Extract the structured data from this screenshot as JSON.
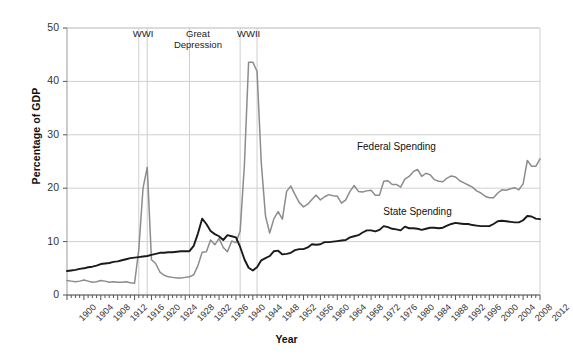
{
  "chart_data": {
    "type": "line",
    "title": "",
    "xlabel": "Year",
    "ylabel": "Percentage of GDP",
    "xlim": [
      1900,
      2012
    ],
    "ylim": [
      0,
      50
    ],
    "yticks": [
      0,
      10,
      20,
      30,
      40,
      50
    ],
    "xticks": [
      1900,
      1904,
      1908,
      1912,
      1916,
      1920,
      1924,
      1928,
      1932,
      1936,
      1940,
      1944,
      1948,
      1952,
      1956,
      1960,
      1964,
      1968,
      1972,
      1976,
      1980,
      1984,
      1988,
      1992,
      1996,
      2000,
      2004,
      2008,
      2012
    ],
    "grid": "horizontal-and-event-markers",
    "legend_position": "inline-labels",
    "colors": {
      "federal": "#8c8c8c",
      "state": "#1a1a1a",
      "grid": "#cfcfcf",
      "axis": "#9a9a9a",
      "background": "#ffffff",
      "text": "#222222"
    },
    "annotations": [
      {
        "label": "WWI",
        "x": 1917,
        "marker_years": [
          1917,
          1919
        ],
        "text_x": 1918,
        "text_y": 49
      },
      {
        "label": "Great\nDepression",
        "x": 1929,
        "marker_years": [
          1929
        ],
        "text_x": 1931,
        "text_y": 49
      },
      {
        "label": "WWII",
        "x": 1941,
        "marker_years": [
          1941,
          1945
        ],
        "text_x": 1943,
        "text_y": 49
      }
    ],
    "series": [
      {
        "name": "Federal Spending",
        "color": "#8c8c8c",
        "label_x": 1978,
        "label_y": 27.5,
        "x": [
          1900,
          1901,
          1902,
          1903,
          1904,
          1905,
          1906,
          1907,
          1908,
          1909,
          1910,
          1911,
          1912,
          1913,
          1914,
          1915,
          1916,
          1917,
          1918,
          1919,
          1920,
          1921,
          1922,
          1923,
          1924,
          1925,
          1926,
          1927,
          1928,
          1929,
          1930,
          1931,
          1932,
          1933,
          1934,
          1935,
          1936,
          1937,
          1938,
          1939,
          1940,
          1941,
          1942,
          1943,
          1944,
          1945,
          1946,
          1947,
          1948,
          1949,
          1950,
          1951,
          1952,
          1953,
          1954,
          1955,
          1956,
          1957,
          1958,
          1959,
          1960,
          1961,
          1962,
          1963,
          1964,
          1965,
          1966,
          1967,
          1968,
          1969,
          1970,
          1971,
          1972,
          1973,
          1974,
          1975,
          1976,
          1977,
          1978,
          1979,
          1980,
          1981,
          1982,
          1983,
          1984,
          1985,
          1986,
          1987,
          1988,
          1989,
          1990,
          1991,
          1992,
          1993,
          1994,
          1995,
          1996,
          1997,
          1998,
          1999,
          2000,
          2001,
          2002,
          2003,
          2004,
          2005,
          2006,
          2007,
          2008,
          2009,
          2010,
          2011,
          2012
        ],
        "y": [
          2.7,
          2.6,
          2.5,
          2.6,
          2.8,
          2.6,
          2.4,
          2.5,
          2.7,
          2.6,
          2.4,
          2.5,
          2.4,
          2.4,
          2.5,
          2.3,
          2.2,
          8.5,
          20.0,
          23.9,
          6.6,
          5.9,
          4.3,
          3.7,
          3.4,
          3.3,
          3.2,
          3.2,
          3.3,
          3.4,
          3.8,
          5.5,
          8.0,
          8.1,
          10.3,
          9.4,
          10.6,
          8.9,
          8.1,
          10.1,
          9.8,
          12.0,
          24.3,
          43.6,
          43.6,
          41.9,
          24.8,
          14.8,
          11.6,
          14.3,
          15.6,
          14.2,
          19.4,
          20.4,
          18.8,
          17.3,
          16.5,
          17.0,
          17.9,
          18.7,
          17.8,
          18.4,
          18.8,
          18.6,
          18.5,
          17.2,
          17.8,
          19.4,
          20.5,
          19.4,
          19.3,
          19.5,
          19.6,
          18.7,
          18.7,
          21.3,
          21.4,
          20.7,
          20.7,
          20.2,
          21.7,
          22.2,
          23.1,
          23.5,
          22.2,
          22.8,
          22.5,
          21.6,
          21.3,
          21.2,
          21.9,
          22.3,
          22.1,
          21.4,
          21.0,
          20.6,
          20.2,
          19.5,
          19.1,
          18.5,
          18.2,
          18.2,
          19.1,
          19.7,
          19.6,
          19.9,
          20.1,
          19.7,
          20.8,
          25.2,
          24.1,
          24.1,
          25.5
        ]
      },
      {
        "name": "State Spending",
        "color": "#1a1a1a",
        "label_x": 1983,
        "label_y": 15.4,
        "x": [
          1900,
          1901,
          1902,
          1903,
          1904,
          1905,
          1906,
          1907,
          1908,
          1909,
          1910,
          1911,
          1912,
          1913,
          1914,
          1915,
          1916,
          1917,
          1918,
          1919,
          1920,
          1921,
          1922,
          1923,
          1924,
          1925,
          1926,
          1927,
          1928,
          1929,
          1930,
          1931,
          1932,
          1933,
          1934,
          1935,
          1936,
          1937,
          1938,
          1939,
          1940,
          1941,
          1942,
          1943,
          1944,
          1945,
          1946,
          1947,
          1948,
          1949,
          1950,
          1951,
          1952,
          1953,
          1954,
          1955,
          1956,
          1957,
          1958,
          1959,
          1960,
          1961,
          1962,
          1963,
          1964,
          1965,
          1966,
          1967,
          1968,
          1969,
          1970,
          1971,
          1972,
          1973,
          1974,
          1975,
          1976,
          1977,
          1978,
          1979,
          1980,
          1981,
          1982,
          1983,
          1984,
          1985,
          1986,
          1987,
          1988,
          1989,
          1990,
          1991,
          1992,
          1993,
          1994,
          1995,
          1996,
          1997,
          1998,
          1999,
          2000,
          2001,
          2002,
          2003,
          2004,
          2005,
          2006,
          2007,
          2008,
          2009,
          2010,
          2011,
          2012
        ],
        "y": [
          4.5,
          4.6,
          4.7,
          4.9,
          5.0,
          5.2,
          5.3,
          5.5,
          5.8,
          5.9,
          6.0,
          6.2,
          6.3,
          6.5,
          6.7,
          6.9,
          7.0,
          7.1,
          7.2,
          7.3,
          7.5,
          7.7,
          7.9,
          7.9,
          8.0,
          8.0,
          8.1,
          8.2,
          8.2,
          8.2,
          9.2,
          11.5,
          14.3,
          13.3,
          12.0,
          11.4,
          11.0,
          10.3,
          11.2,
          11.0,
          10.8,
          9.0,
          6.7,
          5.1,
          4.6,
          5.2,
          6.5,
          6.9,
          7.3,
          8.2,
          8.3,
          7.6,
          7.7,
          7.9,
          8.4,
          8.6,
          8.6,
          8.9,
          9.5,
          9.4,
          9.5,
          9.9,
          9.9,
          10.0,
          10.1,
          10.2,
          10.3,
          10.8,
          11.0,
          11.2,
          11.7,
          12.1,
          12.1,
          11.9,
          12.2,
          12.9,
          12.7,
          12.4,
          12.3,
          12.1,
          12.8,
          12.5,
          12.5,
          12.4,
          12.2,
          12.4,
          12.6,
          12.6,
          12.5,
          12.6,
          13.0,
          13.3,
          13.5,
          13.4,
          13.3,
          13.3,
          13.1,
          13.0,
          12.9,
          12.9,
          12.9,
          13.3,
          13.8,
          13.9,
          13.8,
          13.7,
          13.6,
          13.6,
          14.0,
          14.8,
          14.7,
          14.3,
          14.2
        ]
      }
    ]
  },
  "axis": {
    "ylabel": "Percentage of GDP",
    "xlabel": "Year"
  }
}
